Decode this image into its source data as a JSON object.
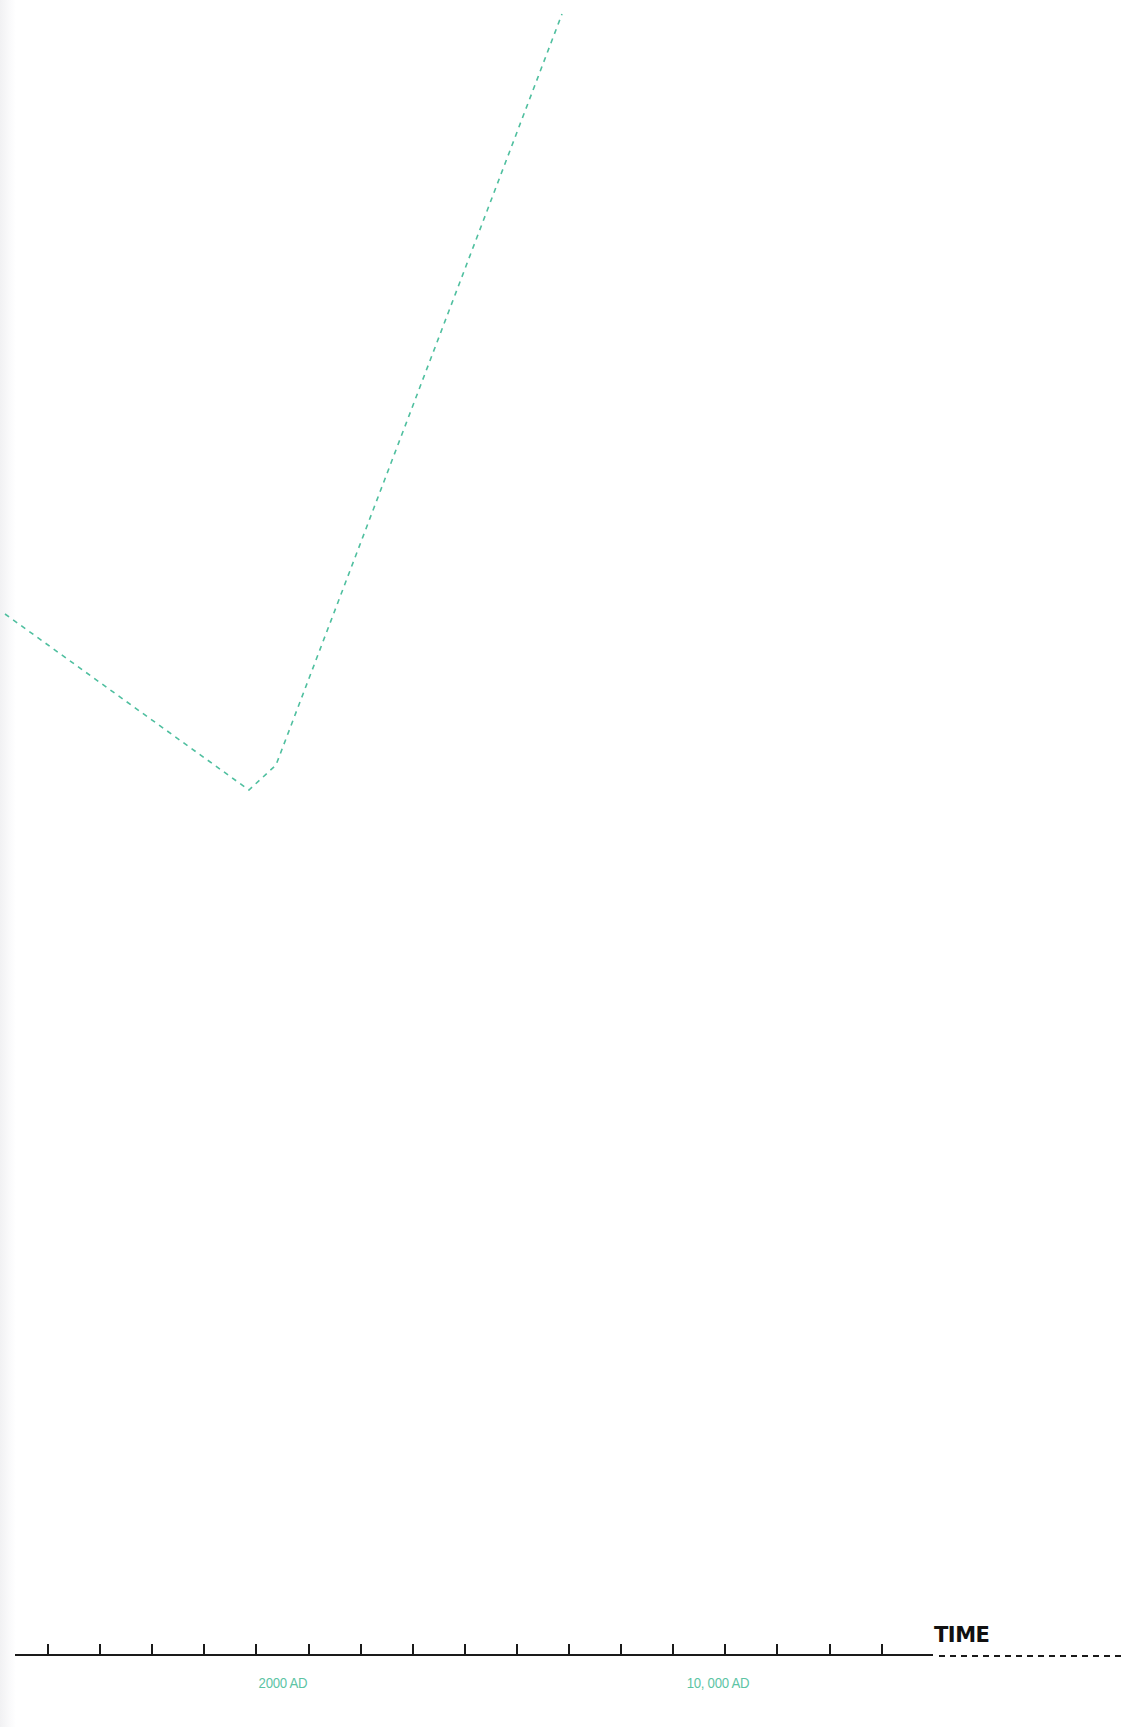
{
  "chart_data": {
    "type": "line",
    "title": "",
    "xlabel": "TIME",
    "ylabel": "",
    "grid": false,
    "legend": null,
    "x_tick_labels": [
      {
        "label": "2000 AD",
        "x": 283
      },
      {
        "label": "10, 000 AD",
        "x": 718
      }
    ],
    "axis": {
      "y": 1655,
      "x_start": 15,
      "x_solid_end": 933,
      "x_dashed_end": 1124,
      "tick_start": 48,
      "tick_step": 52.1,
      "tick_count": 17,
      "tick_height": 11,
      "color": "#1a1a1a"
    },
    "series": [
      {
        "name": "trend",
        "style": "dashed",
        "color": "#4fbf9f",
        "points_px": [
          [
            5,
            614
          ],
          [
            249,
            790
          ],
          [
            276,
            765
          ],
          [
            562,
            14
          ]
        ],
        "description": "Declines gradually from left edge to a minimum near 2000 AD, then rises steeply and continues off the top of the chart"
      }
    ]
  },
  "colors": {
    "accent": "#4fbf9f",
    "label": "#5cc4a4",
    "axis": "#1a1a1a",
    "background": "#ffffff"
  }
}
